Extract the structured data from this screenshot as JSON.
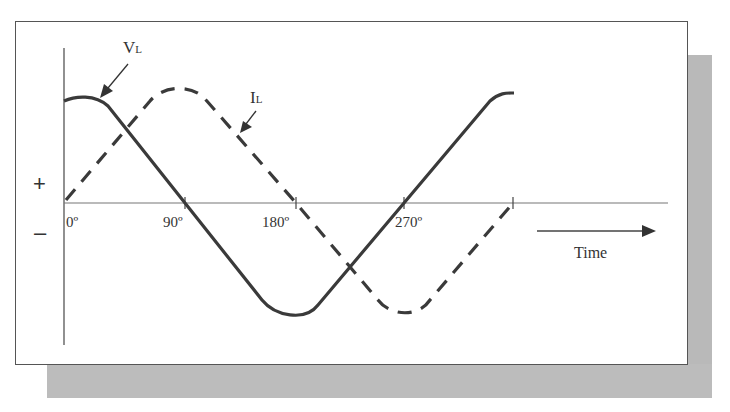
{
  "diagram": {
    "signs": {
      "plus": "+",
      "minus": "–"
    },
    "curves": [
      {
        "name": "V",
        "subscript": "L",
        "style": "solid",
        "description": "Inductor voltage, leads current by 90° (cosine)"
      },
      {
        "name": "I",
        "subscript": "L",
        "style": "dashed",
        "description": "Inductor current (sine)"
      }
    ],
    "x_ticks": [
      "0º",
      "90º",
      "180º",
      "270º"
    ],
    "time_label": "Time",
    "colors": {
      "curve": "#3a3a3a",
      "axis": "#666666",
      "shadow": "#bbbbbb"
    }
  }
}
